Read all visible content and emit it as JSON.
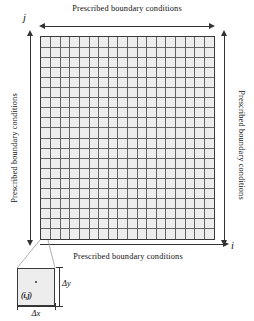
{
  "figure": {
    "boundary_labels": {
      "top": "Prescribed boundary conditions",
      "bottom": "Prescribed boundary conditions",
      "left": "Prescribed boundary conditions",
      "right": "Prescribed boundary conditions"
    },
    "axes": {
      "horizontal_letter": "i",
      "vertical_letter": "j"
    },
    "inset": {
      "cell_label": "(i,j)",
      "height_label": "Δy",
      "width_label": "Δx"
    },
    "colors": {
      "cell_fill": "#ededed",
      "grid_line": "#555555",
      "border": "#3a3a3a",
      "arrow": "#333333",
      "text": "#111111",
      "background": "#ffffff"
    }
  },
  "chart_data": {
    "type": "diagram",
    "subtype": "structured-cartesian-mesh",
    "title": "Prescribed boundary conditions",
    "grid": {
      "columns": 18,
      "rows": 20,
      "cell_width_px": 9.72,
      "cell_height_px": 10.2,
      "origin_corner": "bottom-left",
      "x_index_name": "i",
      "y_index_name": "j",
      "cell_spacing_x": "Δx",
      "cell_spacing_y": "Δy",
      "uniform": true
    },
    "boundaries": [
      {
        "side": "top",
        "condition": "Prescribed boundary conditions",
        "arrow": "double-headed-horizontal"
      },
      {
        "side": "bottom",
        "condition": "Prescribed boundary conditions",
        "arrow": "single-headed-right"
      },
      {
        "side": "left",
        "condition": "Prescribed boundary conditions",
        "arrow": "double-headed-vertical"
      },
      {
        "side": "right",
        "condition": "Prescribed boundary conditions",
        "arrow": "double-headed-vertical"
      }
    ],
    "callout": {
      "source": "bottom-left cell of grid",
      "target": "magnified single cell inset",
      "annotations": [
        "(i,j)",
        "Δy",
        "Δx"
      ]
    }
  }
}
